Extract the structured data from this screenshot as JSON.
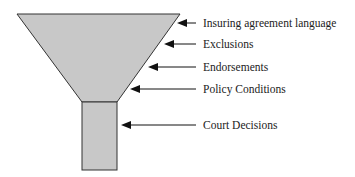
{
  "diagram": {
    "type": "funnel",
    "colors": {
      "fill": "#c8c8c8",
      "stroke": "#333333",
      "arrow": "#111111",
      "text": "#222222"
    },
    "labels": [
      {
        "id": "insuring-agreement",
        "text": "Insuring agreement language"
      },
      {
        "id": "exclusions",
        "text": "Exclusions"
      },
      {
        "id": "endorsements",
        "text": "Endorsements"
      },
      {
        "id": "policy-conditions",
        "text": "Policy Conditions"
      },
      {
        "id": "court-decisions",
        "text": "Court Decisions"
      }
    ]
  }
}
